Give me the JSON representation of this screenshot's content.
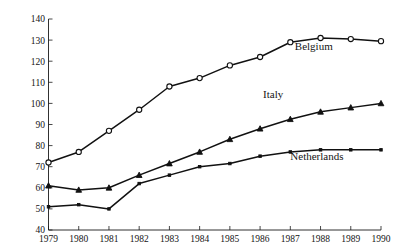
{
  "chart_data": {
    "type": "line",
    "title": "",
    "subtitle": "",
    "xlabel": "",
    "ylabel": "",
    "grid": false,
    "legend_position": "inline-right",
    "x": [
      1979,
      1980,
      1981,
      1982,
      1983,
      1984,
      1985,
      1986,
      1987,
      1988,
      1989,
      1990
    ],
    "categories": [
      "1979",
      "1980",
      "1981",
      "1982",
      "1983",
      "1984",
      "1985",
      "1986",
      "1987",
      "1988",
      "1989",
      "1990"
    ],
    "xlim": [
      1979,
      1990
    ],
    "ylim": [
      40,
      140
    ],
    "ytick_values": [
      40,
      50,
      60,
      70,
      80,
      90,
      100,
      110,
      120,
      130,
      140
    ],
    "ytick_labels": [
      "40",
      "50",
      "60",
      "70",
      "80",
      "90",
      "100",
      "110",
      "120",
      "130",
      "140"
    ],
    "series": [
      {
        "name": "Belgium",
        "marker": "open-circle",
        "values": [
          72,
          77,
          87,
          97,
          108,
          112,
          118,
          122,
          129,
          131,
          130.5,
          129.5
        ]
      },
      {
        "name": "Italy",
        "marker": "filled-triangle",
        "values": [
          61,
          59,
          60,
          66,
          71.5,
          77,
          83,
          88,
          92.5,
          96,
          98,
          100
        ]
      },
      {
        "name": "Netherlands",
        "marker": "filled-square",
        "values": [
          51,
          52,
          50,
          62,
          66,
          70,
          71.5,
          75,
          77,
          78,
          78,
          78
        ]
      }
    ],
    "annotations": [
      {
        "text": "Belgium",
        "x": 1987.15,
        "y": 125.5
      },
      {
        "text": "Italy",
        "x": 1986.1,
        "y": 102.5
      },
      {
        "text": "Netherlands",
        "x": 1987.0,
        "y": 73.0
      }
    ],
    "colors": {
      "line": "#111111",
      "axis": "#1a1a1a",
      "text": "#141414",
      "background": "#ffffff",
      "marker_fill_open": "#ffffff"
    }
  }
}
